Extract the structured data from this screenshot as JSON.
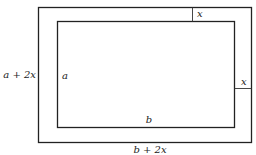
{
  "diagram": {
    "colors": {
      "line": "#222222",
      "background": "#ffffff"
    },
    "labels": {
      "outer_height": "a + 2x",
      "inner_height": "a",
      "inner_width": "b",
      "outer_width": "b + 2x",
      "border_top": "x",
      "border_right": "x"
    }
  }
}
